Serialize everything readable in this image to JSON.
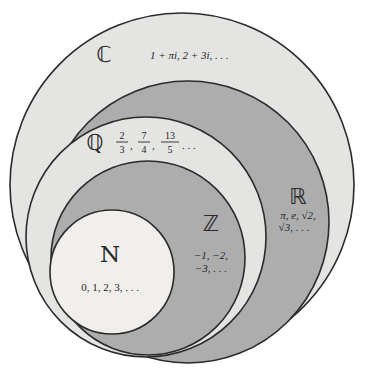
{
  "diagram": {
    "background_color": "#ffffff",
    "stroke_color": "#2b2b2b",
    "sets": [
      {
        "key": "C",
        "symbol": "ℂ",
        "name": "complex-numbers",
        "fill": "#e4e4e2",
        "examples": "1 + πi, 2 + 3i, . . .",
        "examples_plain": "1 + pi*i, 2 + 3i, ..."
      },
      {
        "key": "R",
        "symbol": "ℝ",
        "name": "real-numbers",
        "fill": "#adadad",
        "examples_line1": "π, e, √2,",
        "examples_line2": "√3, . . ."
      },
      {
        "key": "Q",
        "symbol": "ℚ",
        "name": "rational-numbers",
        "fill": "#e4e4e2",
        "examples": "2/3, 7/4, 13/5, . . .",
        "fractions": [
          {
            "num": "2",
            "den": "3"
          },
          {
            "num": "7",
            "den": "4"
          },
          {
            "num": "13",
            "den": "5"
          }
        ],
        "ellipsis": ". . ."
      },
      {
        "key": "Z",
        "symbol": "ℤ",
        "name": "integers",
        "fill": "#adadad",
        "examples_line1": "−1, −2,",
        "examples_line2": "−3, . . ."
      },
      {
        "key": "N",
        "symbol": "N",
        "name": "natural-numbers",
        "fill": "#f0efec",
        "examples": "0, 1, 2, 3, . . ."
      }
    ]
  }
}
